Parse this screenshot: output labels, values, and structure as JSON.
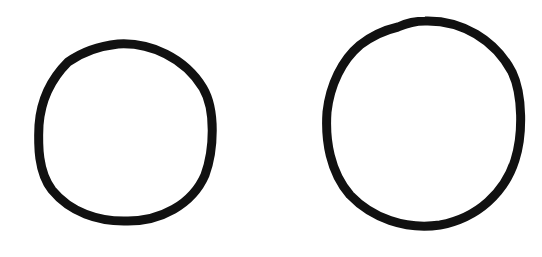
{
  "canvas": {
    "width": 542,
    "height": 257,
    "background": "#ffffff"
  },
  "shapes": [
    {
      "id": "left-circle",
      "type": "circle-outline",
      "cx": 126,
      "cy": 132,
      "rx": 87,
      "ry": 88,
      "stroke": "#111111",
      "stroke_width": 9
    },
    {
      "id": "right-circle",
      "type": "circle-outline",
      "cx": 423,
      "cy": 123,
      "rx": 96,
      "ry": 102,
      "stroke": "#111111",
      "stroke_width": 9
    }
  ]
}
